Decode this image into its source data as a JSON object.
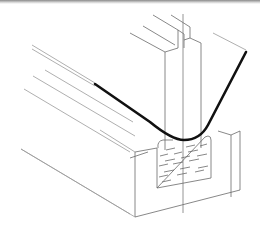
{
  "figure": {
    "kind": "technical line drawing",
    "parts": [
      {
        "id": "punch",
        "label": "vertical punch plate"
      },
      {
        "id": "sheet",
        "label": "bent sheet (thick black line)"
      },
      {
        "id": "die-block",
        "label": "rectangular die block"
      },
      {
        "id": "pad",
        "label": "elastic pad insert with hatched texture"
      },
      {
        "id": "centerline",
        "label": "vertical centerline"
      }
    ],
    "colors": {
      "line": "#6a6a6a",
      "sheet": "#111111",
      "background": "#ffffff",
      "top_band": "#8a8a8a"
    }
  }
}
